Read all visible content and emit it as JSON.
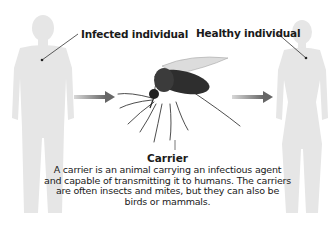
{
  "diagram": {
    "infected_label": "Infected individual",
    "healthy_label": "Healthy individual",
    "carrier_title": "Carrier",
    "carrier_description_lines": [
      "A carrier is an animal carrying an infectious agent",
      "and capable of transmitting it to humans. The carriers",
      "are often insects and mites, but they can also be",
      "birds or mammals."
    ],
    "icons": {
      "left": "human-silhouette-male",
      "center": "mosquito",
      "right": "human-silhouette-female",
      "arrows": [
        "arrow-right",
        "arrow-right"
      ]
    },
    "colors": {
      "silhouette": "#e6e6e6",
      "arrow": "#6f6f6f",
      "text": "#1a1a1a"
    }
  }
}
